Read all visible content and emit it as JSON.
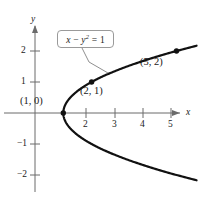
{
  "figure": {
    "title": "",
    "callout": {
      "equation_lhs": "x",
      "equation_op": " − ",
      "equation_var": "y",
      "equation_exp": "2",
      "equation_rhs": " = 1",
      "equation_plain": "x − y² = 1"
    },
    "axes": {
      "x_name": "x",
      "y_name": "y",
      "x_ticks": [
        "2",
        "3",
        "4",
        "5"
      ],
      "y_ticks": [
        "2",
        "1",
        "−1",
        "−2"
      ],
      "xlim": [
        -1.0,
        5.8
      ],
      "ylim": [
        -2.6,
        2.6
      ],
      "grid": false
    },
    "point_labels": [
      {
        "text": "(1, 0)",
        "x": 1,
        "y": 0
      },
      {
        "text": "(2, 1)",
        "x": 2,
        "y": 1
      },
      {
        "text": "(5, 2)",
        "x": 5,
        "y": 2
      }
    ],
    "colors": {
      "curve": "#111111",
      "axis": "#6b6b6b",
      "callout_border": "#9a9a9a",
      "text": "#1a1a1a",
      "background": "#ffffff"
    }
  },
  "chart_data": {
    "type": "line",
    "title": "",
    "xlabel": "x",
    "ylabel": "y",
    "xlim": [
      -1.0,
      5.8
    ],
    "ylim": [
      -2.6,
      2.6
    ],
    "grid": false,
    "legend": null,
    "annotations": [
      {
        "text": "x − y² = 1",
        "kind": "callout",
        "target_x": 2.6,
        "target_y": 1.27
      },
      {
        "text": "(1, 0)",
        "kind": "point-label",
        "x": 1,
        "y": 0
      },
      {
        "text": "(2, 1)",
        "kind": "point-label",
        "x": 2,
        "y": 1
      },
      {
        "text": "(5, 2)",
        "kind": "point-label",
        "x": 5,
        "y": 2
      }
    ],
    "series": [
      {
        "name": "x − y² = 1",
        "equation": "x = y^2 + 1",
        "x": [
          6.05,
          5.0,
          4.0,
          3.25,
          2.56,
          2.0,
          1.56,
          1.25,
          1.0625,
          1.0,
          1.0625,
          1.25,
          1.56,
          2.0,
          2.56,
          3.25,
          4.0,
          5.0,
          6.05
        ],
        "y": [
          2.25,
          2.0,
          1.732,
          1.5,
          1.25,
          1.0,
          0.75,
          0.5,
          0.25,
          0.0,
          -0.25,
          -0.5,
          -0.75,
          -1.0,
          -1.25,
          -1.5,
          -1.732,
          -2.0,
          -2.25
        ]
      }
    ],
    "markers": [
      {
        "x": 1,
        "y": 0,
        "label": "(1, 0)"
      },
      {
        "x": 2,
        "y": 1,
        "label": "(2, 1)"
      },
      {
        "x": 5,
        "y": 2,
        "label": "(5, 2)"
      }
    ],
    "x_tick_values": [
      2,
      3,
      4,
      5
    ],
    "y_tick_values": [
      2,
      1,
      -1,
      -2
    ]
  }
}
